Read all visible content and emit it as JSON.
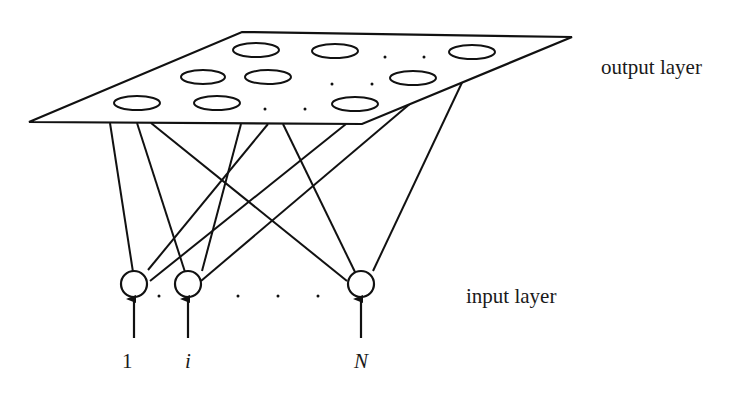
{
  "diagram": {
    "type": "neural-network-architecture",
    "labels": {
      "output_layer": "output layer",
      "input_layer": "input layer"
    },
    "input_nodes": [
      {
        "label": "1",
        "italic": false
      },
      {
        "label": "i",
        "italic": true
      },
      {
        "label": "N",
        "italic": true
      }
    ],
    "ellipsis": ". . . .",
    "output_grid": {
      "rows": 3,
      "visible_units_per_row": 3,
      "ellipsis_between": true
    },
    "colors": {
      "stroke": "#111111",
      "background": "#ffffff",
      "text": "#1a1a1a"
    }
  }
}
